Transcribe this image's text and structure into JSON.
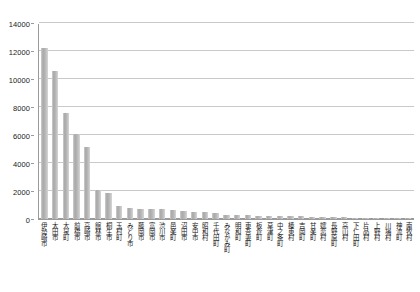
{
  "chart_data": {
    "type": "bar",
    "title": "",
    "subtitle": "",
    "xlabel": "",
    "ylabel": "",
    "ylim": [
      0,
      14000
    ],
    "ytick_step": 2000,
    "yticks": [
      0,
      2000,
      4000,
      6000,
      8000,
      10000,
      12000,
      14000
    ],
    "ytick_labels": [
      "0",
      "2000",
      "4000",
      "6000",
      "8000",
      "10000",
      "12000",
      "14000"
    ],
    "grid": true,
    "legend": false,
    "legend_position": "none",
    "bar_color": "#b4b4b4",
    "axis_color": "#9a9a9a",
    "gridline_color": "#c9c9c9",
    "categories": [
      "伊勢崎市",
      "太田市",
      "大泉町",
      "前橋市",
      "高崎市",
      "館林市",
      "桐生市",
      "玉村町",
      "みどり市",
      "藤岡市",
      "富岡市",
      "渋川市",
      "邑楽町",
      "沼田市",
      "安中市",
      "昭和村",
      "千代田町",
      "みなかみ町",
      "明和町",
      "東吾妻町",
      "板倉町",
      "草津町",
      "中之条町",
      "榛東村",
      "吉岡町",
      "甘楽町",
      "嬬恋村",
      "長野原町",
      "高山村",
      "下仁田町",
      "片品村",
      "上野村",
      "川場村",
      "神流町",
      "南牧村"
    ],
    "values": [
      12200,
      10600,
      7550,
      6100,
      5150,
      2100,
      1870,
      940,
      760,
      740,
      700,
      680,
      620,
      560,
      520,
      500,
      460,
      320,
      300,
      280,
      250,
      240,
      220,
      200,
      180,
      170,
      150,
      130,
      110,
      95,
      70,
      55,
      40,
      25,
      15
    ]
  }
}
